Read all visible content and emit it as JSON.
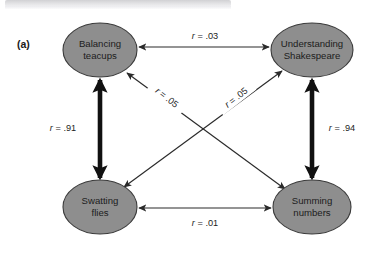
{
  "figure": {
    "panel_label": "(a)",
    "nodes": [
      {
        "id": "balancing-teacups",
        "line1": "Balancing",
        "line2": "teacups",
        "cx": 100,
        "cy": 50,
        "rx": 37,
        "ry": 27
      },
      {
        "id": "understanding-shakespeare",
        "line1": "Understanding",
        "line2": "Shakespeare",
        "cx": 312,
        "cy": 50,
        "rx": 41,
        "ry": 27
      },
      {
        "id": "swatting-flies",
        "line1": "Swatting",
        "line2": "flies",
        "cx": 100,
        "cy": 207,
        "rx": 37,
        "ry": 27
      },
      {
        "id": "summing-numbers",
        "line1": "Summing",
        "line2": "numbers",
        "cx": 312,
        "cy": 207,
        "rx": 39,
        "ry": 27
      }
    ],
    "links": [
      {
        "id": "top-horizontal",
        "from": "balancing-teacups",
        "to": "understanding-shakespeare",
        "weight": "thin",
        "arrows": "both",
        "label_prefix": "r",
        "label_value": " = .03",
        "label_x": 205,
        "label_y": 39,
        "label_rotation": 0
      },
      {
        "id": "bottom-horizontal",
        "from": "swatting-flies",
        "to": "summing-numbers",
        "weight": "thin",
        "arrows": "both",
        "label_prefix": "r",
        "label_value": " = .01",
        "label_x": 205,
        "label_y": 226,
        "label_rotation": 0
      },
      {
        "id": "left-vertical",
        "from": "balancing-teacups",
        "to": "swatting-flies",
        "weight": "thick",
        "arrows": "both",
        "label_prefix": "r",
        "label_value": " = .91",
        "label_x": 63,
        "label_y": 131,
        "label_rotation": 0
      },
      {
        "id": "right-vertical",
        "from": "understanding-shakespeare",
        "to": "summing-numbers",
        "weight": "thick",
        "arrows": "both",
        "label_prefix": "r",
        "label_value": " = .94",
        "label_x": 342,
        "label_y": 131,
        "label_rotation": 0
      },
      {
        "id": "diagonal-teacups-numbers",
        "from": "balancing-teacups",
        "to": "summing-numbers",
        "weight": "thin",
        "arrows": "both",
        "label_prefix": "r",
        "label_value": " = .05",
        "label_x": 165,
        "label_y": 100,
        "label_rotation": 38
      },
      {
        "id": "diagonal-shakespeare-flies",
        "from": "understanding-shakespeare",
        "to": "swatting-flies",
        "weight": "thin",
        "arrows": "both",
        "label_prefix": "r",
        "label_value": " = .05",
        "label_x": 238,
        "label_y": 100,
        "label_rotation": -38
      }
    ],
    "colors": {
      "node_fill": "#8e8e8e",
      "node_stroke": "#3a3a3a",
      "link_thin": "#2a2a2a",
      "link_thick": "#111111",
      "text": "#1c1c1c",
      "background": "#ffffff"
    }
  }
}
